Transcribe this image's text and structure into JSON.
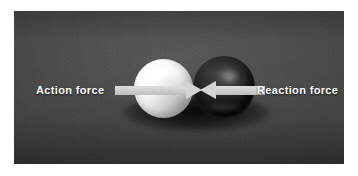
{
  "figure": {
    "name": "action-reaction-force-photo",
    "caption_text": "",
    "background_color": "#ffffff",
    "photo_background_color": "#4b4b4b"
  },
  "labels": {
    "action": "Action force",
    "reaction": "Reaction force"
  },
  "objects": {
    "light_ball": {
      "name": "white-ball",
      "color": "#ffffff"
    },
    "dark_ball": {
      "name": "black-ball",
      "color": "#121212"
    }
  },
  "arrows": {
    "action": {
      "name": "action-force-arrow",
      "direction": "right",
      "color": "#d4d4d4"
    },
    "reaction": {
      "name": "reaction-force-arrow",
      "direction": "left",
      "color": "#d4d4d4"
    }
  }
}
